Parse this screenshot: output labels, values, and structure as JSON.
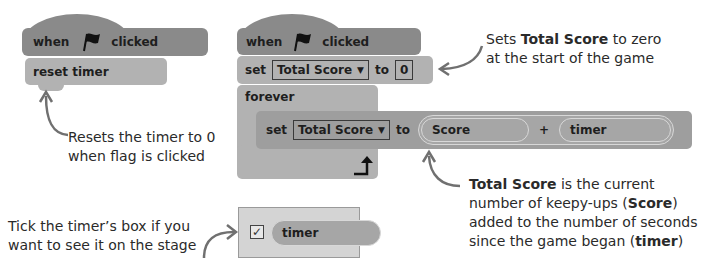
{
  "left_script": {
    "hat_block": {
      "when": "when",
      "flag_icon": "green-flag",
      "clicked": "clicked"
    },
    "reset_block": {
      "label": "reset timer"
    },
    "annotation": [
      "Resets the timer to 0",
      "when flag is clicked"
    ]
  },
  "right_script": {
    "hat_block": {
      "when": "when",
      "flag_icon": "green-flag",
      "clicked": "clicked"
    },
    "set_block": {
      "set": "set",
      "variable": "Total Score",
      "to": "to",
      "value": "0"
    },
    "forever_block": {
      "label": "forever",
      "loop_icon": "loop-arrow"
    },
    "inner_set_block": {
      "set": "set",
      "variable": "Total Score",
      "to": "to",
      "operand1": "Score",
      "operator": "+",
      "operand2": "timer"
    },
    "annotation_top": {
      "pre": "Sets ",
      "bold": "Total Score",
      "post": " to zero",
      "line2": "at the start of the game"
    },
    "annotation_bottom": {
      "line1_bold": "Total Score",
      "line1_rest": " is the current",
      "line2_pre": "number of keepy-ups (",
      "line2_bold": "Score",
      "line2_post": ")",
      "line3": "added to the number of seconds",
      "line4_pre": "since the game began (",
      "line4_bold": "timer",
      "line4_post": ")"
    }
  },
  "timer_panel": {
    "checkbox_checked": true,
    "reporter_label": "timer",
    "annotation": [
      "Tick the timer’s box if you",
      "want to see it on the stage"
    ]
  },
  "colors": {
    "hat": "#8a8a8a",
    "stack": "#b2b2b2",
    "panel": "#d4d4d4",
    "arrow": "#707070"
  }
}
